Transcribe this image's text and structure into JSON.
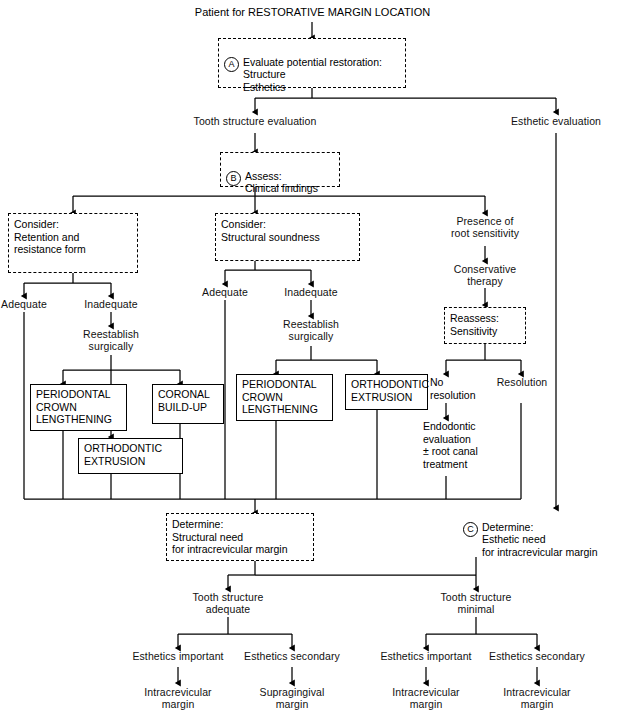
{
  "diagram": {
    "title": "Patient for RESTORATIVE MARGIN LOCATION",
    "nodes": {
      "boxA": {
        "marker": "A",
        "text": "Evaluate potential restoration:\n    Structure\n    Esthetics"
      },
      "tooth_structure_evaluation": "Tooth structure evaluation",
      "esthetic_evaluation": "Esthetic evaluation",
      "boxB": {
        "marker": "B",
        "text": "Assess:\n    Clinical findings"
      },
      "consider_retention": "Consider:\n   Retention and\n   resistance form",
      "consider_structural": "Consider:\n   Structural soundness",
      "presence_root_sensitivity": "Presence of\nroot sensitivity",
      "conservative_therapy": "Conservative\ntherapy",
      "reassess_sensitivity": "Reassess:\n   Sensitivity",
      "adequate_left": "Adequate",
      "inadequate_left": "Inadequate",
      "adequate_mid": "Adequate",
      "inadequate_mid": "Inadequate",
      "reestablish_left": "Reestablish\nsurgically",
      "reestablish_mid": "Reestablish\nsurgically",
      "no_resolution": "No\nresolution",
      "resolution": "Resolution",
      "endodontic_evaluation": "Endodontic\nevaluation\n± root canal\ntreatment",
      "pcl_left": "PERIODONTAL\nCROWN\nLENGTHENING",
      "coronal_buildup": "CORONAL\nBUILD-UP",
      "ortho_extrusion_left": "ORTHODONTIC\nEXTRUSION",
      "pcl_mid": "PERIODONTAL\nCROWN\nLENGTHENING",
      "ortho_extrusion_mid": "ORTHODONTIC\nEXTRUSION",
      "determine_structural": "Determine:\n   Structural need\n   for intracrevicular margin",
      "determine_esthetic": {
        "marker": "C",
        "text": "Determine:\n    Esthetic need\n    for intracrevicular margin"
      },
      "tooth_structure_adequate": "Tooth structure\nadequate",
      "tooth_structure_minimal": "Tooth structure\nminimal",
      "esthetics_important_1": "Esthetics important",
      "esthetics_secondary_1": "Esthetics secondary",
      "esthetics_important_2": "Esthetics important",
      "esthetics_secondary_2": "Esthetics secondary",
      "outcome_1": "Intracrevicular\nmargin",
      "outcome_2": "Supragingival\nmargin",
      "outcome_3": "Intracrevicular\nmargin",
      "outcome_4": "Intracrevicular\nmargin"
    },
    "colors": {
      "line": "#000000",
      "background": "#ffffff",
      "text": "#111111"
    }
  }
}
